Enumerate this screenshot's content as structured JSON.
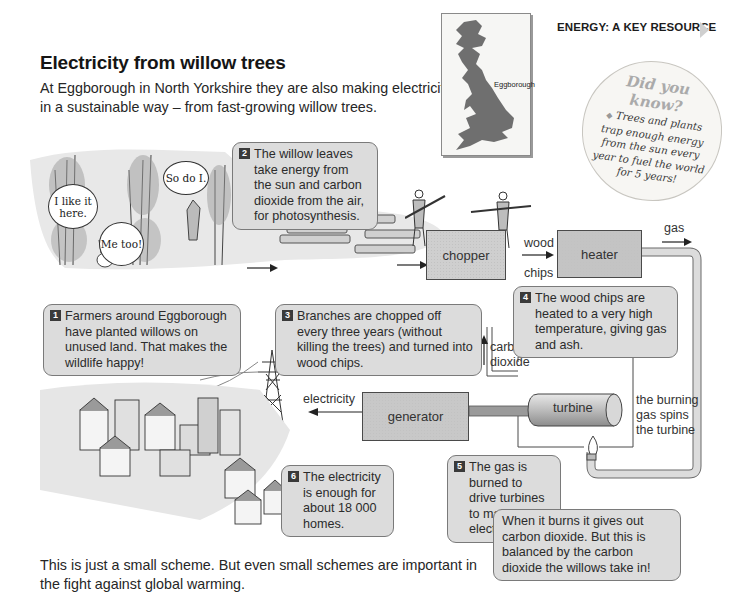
{
  "header": {
    "section_tag": "ENERGY: A KEY RESOURCE",
    "title": "Electricity from willow trees",
    "intro": "At Eggborough in North Yorkshire they are also making electricity in a sustainable way – from fast-growing willow trees."
  },
  "map": {
    "label": "Eggborough",
    "colors": {
      "land": "#6f6f6f",
      "card": "#f6f6f4"
    }
  },
  "did_you_know": {
    "heading_line1": "Did you",
    "heading_line2": "know?",
    "bullet": "◆",
    "body": "Trees and plants trap enough energy from the sun every year to fuel the world for 5 years!"
  },
  "speech_bubbles": [
    {
      "text": "I like it here."
    },
    {
      "text": "So do I."
    },
    {
      "text": "Me too!"
    }
  ],
  "steps": [
    {
      "number": "1",
      "text": "Farmers around Eggborough have planted willows on unused land. That makes the wildlife happy!"
    },
    {
      "number": "2",
      "text": "The willow leaves take energy from the sun and carbon dioxide from the air, for photosynthesis."
    },
    {
      "number": "3",
      "text": "Branches are chopped off every three years (without killing the trees) and turned into wood chips."
    },
    {
      "number": "4",
      "text": "The wood chips are heated to a very high temperature, giving gas and ash."
    },
    {
      "number": "5",
      "text": "The gas is burned to drive turbines to make electricity."
    },
    {
      "number": "6",
      "text": "The electricity is enough for about 18 000 homes."
    }
  ],
  "step5_note": "When it burns it gives out carbon dioxide. But this is balanced by the carbon dioxide the willows take in!",
  "process": {
    "chopper": "chopper",
    "heater": "heater",
    "generator": "generator",
    "turbine": "turbine"
  },
  "flow_labels": {
    "wood_chips_line1": "wood",
    "wood_chips_line2": "chips",
    "gas": "gas",
    "carbon_dioxide_line1": "carbon",
    "carbon_dioxide_line2": "dioxide",
    "burning_line1": "the burning",
    "burning_line2": "gas spins",
    "burning_line3": "the turbine",
    "electricity": "electricity"
  },
  "outro": "This is just a small scheme. But even small schemes are important in the fight against global warming.",
  "colors": {
    "bubble_fill": "#dcdcdc",
    "bubble_border": "#7a7a7a",
    "number_badge": "#3a3a3a",
    "pipe": "#d6d6d6"
  }
}
